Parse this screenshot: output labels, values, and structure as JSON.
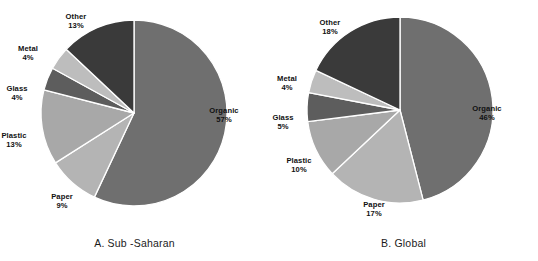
{
  "figure": {
    "background": "#ffffff",
    "panel_count": 2
  },
  "palette": {
    "organic": "#6f6f6f",
    "paper": "#b4b4b4",
    "plastic": "#a8a8a8",
    "glass": "#5d5d5d",
    "metal": "#bdbdbd",
    "other": "#3a3a3a",
    "divider": "#ffffff",
    "text": "#111111"
  },
  "panels": [
    {
      "id": "sub-saharan",
      "caption": "A. Sub -Saharan",
      "labels": [
        {
          "name": "Organic",
          "value": "57%"
        },
        {
          "name": "Paper",
          "value": "9%"
        },
        {
          "name": "Plastic",
          "value": "13%"
        },
        {
          "name": "Glass",
          "value": "4%"
        },
        {
          "name": "Metal",
          "value": "4%"
        },
        {
          "name": "Other",
          "value": "13%"
        }
      ]
    },
    {
      "id": "global",
      "caption": "B. Global",
      "labels": [
        {
          "name": "Organic",
          "value": "46%"
        },
        {
          "name": "Paper",
          "value": "17%"
        },
        {
          "name": "Plastic",
          "value": "10%"
        },
        {
          "name": "Glass",
          "value": "5%"
        },
        {
          "name": "Metal",
          "value": "4%"
        },
        {
          "name": "Other",
          "value": "18%"
        }
      ]
    }
  ],
  "chart_data": [
    {
      "type": "pie",
      "title": "A. Sub -Saharan",
      "categories": [
        "Organic",
        "Paper",
        "Plastic",
        "Glass",
        "Metal",
        "Other"
      ],
      "values": [
        57,
        9,
        13,
        4,
        4,
        13
      ],
      "unit": "percent",
      "data_labels": [
        "57%",
        "9%",
        "13%",
        "4%",
        "4%",
        "13%"
      ],
      "colors": [
        "#6f6f6f",
        "#b4b4b4",
        "#a8a8a8",
        "#5d5d5d",
        "#bdbdbd",
        "#3a3a3a"
      ],
      "start_angle_deg": 0,
      "direction": "clockwise",
      "legend": "none",
      "labels_position": "outside-radial",
      "grid": false
    },
    {
      "type": "pie",
      "title": "B. Global",
      "categories": [
        "Organic",
        "Paper",
        "Plastic",
        "Glass",
        "Metal",
        "Other"
      ],
      "values": [
        46,
        17,
        10,
        5,
        4,
        18
      ],
      "unit": "percent",
      "data_labels": [
        "46%",
        "17%",
        "10%",
        "5%",
        "4%",
        "18%"
      ],
      "colors": [
        "#6f6f6f",
        "#b4b4b4",
        "#a8a8a8",
        "#5d5d5d",
        "#bdbdbd",
        "#3a3a3a"
      ],
      "start_angle_deg": 0,
      "direction": "clockwise",
      "legend": "none",
      "labels_position": "outside-radial",
      "grid": false
    }
  ]
}
